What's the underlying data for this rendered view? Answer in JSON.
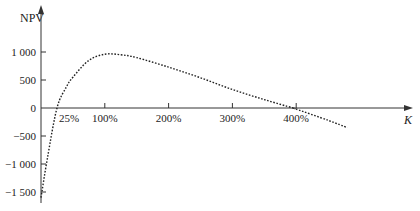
{
  "chart_data": {
    "type": "line",
    "title": "",
    "xlabel": "K",
    "ylabel": "NPV",
    "x_unit": "%",
    "x_ticks": [
      25,
      100,
      200,
      300,
      400
    ],
    "x_tick_labels": [
      "25%",
      "100%",
      "200%",
      "300%",
      "400%"
    ],
    "y_ticks": [
      1000,
      500,
      0,
      -500,
      -1000,
      -1500
    ],
    "y_tick_labels": [
      "1 000",
      "500",
      "0",
      "−500",
      "−1 000",
      "−1 500"
    ],
    "xlim": [
      0,
      530
    ],
    "ylim": [
      -1700,
      1850
    ],
    "grid": false,
    "legend": null,
    "line_style": "dotted",
    "series": [
      {
        "name": "NPV",
        "x": [
          0,
          10,
          25,
          40,
          50,
          75,
          100,
          125,
          150,
          200,
          250,
          300,
          350,
          395,
          400,
          450,
          480
        ],
        "y": [
          -1600,
          -900,
          0,
          380,
          550,
          850,
          960,
          950,
          900,
          730,
          540,
          330,
          150,
          0,
          -20,
          -220,
          -350
        ]
      }
    ]
  },
  "labels": {
    "y_axis": "NPV",
    "x_axis": "K"
  }
}
